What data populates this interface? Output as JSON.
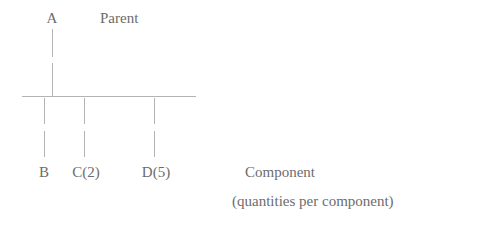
{
  "diagram": {
    "title_text": "Parent",
    "root": {
      "label": "A",
      "x": 52,
      "y": 10
    },
    "parent_caption": {
      "label": "Parent",
      "x": 100,
      "y": 10
    },
    "children": [
      {
        "label": "B",
        "x": 44,
        "y": 164
      },
      {
        "label": "C(2)",
        "x": 86,
        "y": 164
      },
      {
        "label": "D(5)",
        "x": 156,
        "y": 164
      }
    ],
    "legend": [
      {
        "label": "Component",
        "x": 245,
        "y": 164
      },
      {
        "label": "(quantities per component)",
        "x": 232,
        "y": 193
      }
    ],
    "colors": {
      "text": "#6c6c6c",
      "line": "#b3b3b3",
      "background": "#ffffff"
    },
    "geometry": {
      "bar_left": 22,
      "bar_right": 196,
      "bar_y": 96,
      "root_stem_x": 52,
      "root_stem_top": 29,
      "root_stem_gap_top": 57,
      "root_stem_gap_bottom": 63,
      "root_stem_bottom": 96,
      "child_stem_top": 98,
      "child_stem_gap_top": 124,
      "child_stem_gap_bottom": 131,
      "child_stem_bottom": 157,
      "child_stem_xs": [
        44,
        84,
        154
      ]
    }
  }
}
